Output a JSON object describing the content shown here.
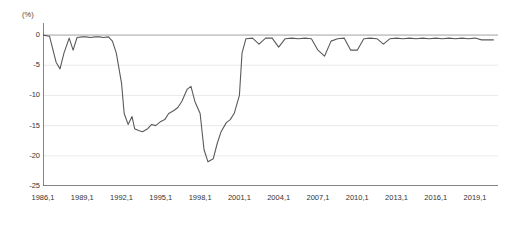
{
  "chart_data": {
    "type": "line",
    "title": "",
    "subtitle": "",
    "unit_label": "(%)",
    "xlabel": "",
    "ylabel": "",
    "ylim": [
      -25,
      2
    ],
    "grid": true,
    "legend": "none",
    "y_ticks": [
      0,
      -5,
      -10,
      -15,
      -20,
      -25
    ],
    "y_tick_labels": [
      "0",
      "-5",
      "-10",
      "-15",
      "-20",
      "-25"
    ],
    "x_ticks": [
      "1986,1",
      "1989,1",
      "1992,1",
      "1995,1",
      "1998,1",
      "2001,1",
      "2004,1",
      "2007,1",
      "2010,1",
      "2013,1",
      "2016,1",
      "2019,1"
    ],
    "x_range": [
      "1986,1",
      "2020,4"
    ],
    "series": [
      {
        "name": "series-1",
        "color": "#5a5a5a",
        "x": [
          1986.0,
          1986.5,
          1987.0,
          1987.3,
          1987.6,
          1988.0,
          1988.3,
          1988.6,
          1989.0,
          1989.3,
          1989.6,
          1990.0,
          1990.3,
          1990.6,
          1991.0,
          1991.3,
          1991.6,
          1992.0,
          1992.2,
          1992.5,
          1992.8,
          1993.0,
          1993.3,
          1993.6,
          1994.0,
          1994.3,
          1994.6,
          1995.0,
          1995.3,
          1995.6,
          1996.0,
          1996.3,
          1996.6,
          1997.0,
          1997.3,
          1997.6,
          1998.0,
          1998.3,
          1998.6,
          1999.0,
          1999.3,
          1999.6,
          2000.0,
          2000.3,
          2000.6,
          2001.0,
          2001.2,
          2001.5,
          2002.0,
          2002.5,
          2003.0,
          2003.5,
          2004.0,
          2004.5,
          2005.0,
          2005.5,
          2006.0,
          2006.5,
          2007.0,
          2007.5,
          2008.0,
          2008.5,
          2009.0,
          2009.5,
          2010.0,
          2010.5,
          2011.0,
          2011.5,
          2012.0,
          2012.5,
          2013.0,
          2013.5,
          2014.0,
          2014.5,
          2015.0,
          2015.5,
          2016.0,
          2016.5,
          2017.0,
          2017.5,
          2018.0,
          2018.5,
          2019.0,
          2019.5,
          2020.0,
          2020.4
        ],
        "y": [
          0.0,
          -0.2,
          -4.5,
          -5.6,
          -3.0,
          -0.5,
          -2.5,
          -0.4,
          -0.3,
          -0.3,
          -0.4,
          -0.3,
          -0.3,
          -0.4,
          -0.3,
          -1.0,
          -3.0,
          -8.0,
          -13.0,
          -14.8,
          -13.5,
          -15.5,
          -15.8,
          -16.0,
          -15.5,
          -14.8,
          -15.0,
          -14.3,
          -14.0,
          -13.0,
          -12.5,
          -12.0,
          -11.0,
          -9.0,
          -8.5,
          -11.0,
          -13.0,
          -19.0,
          -21.0,
          -20.5,
          -18.0,
          -16.0,
          -14.5,
          -14.0,
          -13.0,
          -10.0,
          -3.0,
          -0.6,
          -0.5,
          -1.5,
          -0.5,
          -0.5,
          -2.0,
          -0.6,
          -0.5,
          -0.6,
          -0.5,
          -0.6,
          -2.5,
          -3.5,
          -1.0,
          -0.6,
          -0.5,
          -2.5,
          -2.5,
          -0.6,
          -0.5,
          -0.6,
          -1.5,
          -0.6,
          -0.5,
          -0.6,
          -0.5,
          -0.6,
          -0.5,
          -0.6,
          -0.5,
          -0.6,
          -0.5,
          -0.6,
          -0.5,
          -0.6,
          -0.5,
          -0.8,
          -0.8,
          -0.8
        ]
      }
    ]
  }
}
